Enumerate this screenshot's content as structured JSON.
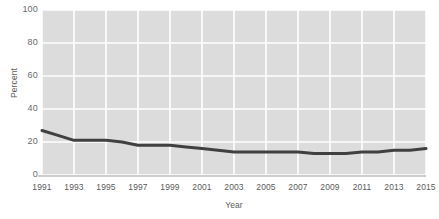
{
  "chart_data": {
    "type": "line",
    "title": "",
    "xlabel": "Year",
    "ylabel": "Percent",
    "x": [
      1991,
      1992,
      1993,
      1994,
      1995,
      1996,
      1997,
      1998,
      1999,
      2000,
      2001,
      2002,
      2003,
      2004,
      2005,
      2006,
      2007,
      2008,
      2009,
      2010,
      2011,
      2012,
      2013,
      2014,
      2015
    ],
    "values": [
      27,
      24,
      21,
      21,
      21,
      20,
      18,
      18,
      18,
      17,
      16,
      15,
      14,
      14,
      14,
      14,
      14,
      13,
      13,
      13,
      14,
      14,
      15,
      15,
      16
    ],
    "series": [
      {
        "name": "Percent",
        "color": "#404040",
        "values": [
          27,
          24,
          21,
          21,
          21,
          20,
          18,
          18,
          18,
          17,
          16,
          15,
          14,
          14,
          14,
          14,
          14,
          13,
          13,
          13,
          14,
          14,
          15,
          15,
          16
        ]
      }
    ],
    "xlim": [
      1991,
      2015
    ],
    "ylim": [
      0,
      100
    ],
    "y_ticks": [
      0,
      20,
      40,
      60,
      80,
      100
    ],
    "y_tick_labels": [
      "0",
      "20",
      "40",
      "60",
      "80",
      "100"
    ],
    "x_ticks": [
      1991,
      1993,
      1995,
      1997,
      1999,
      2001,
      2003,
      2005,
      2007,
      2009,
      2011,
      2013,
      2015
    ],
    "x_tick_labels": [
      "1991",
      "1993",
      "1995",
      "1997",
      "1999",
      "2001",
      "2003",
      "2005",
      "2007",
      "2009",
      "2011",
      "2013",
      "2015"
    ],
    "grid": true,
    "grid_color": "#ffffff",
    "plot_background": "#dcdcdc",
    "legend": null,
    "legend_position": "none"
  }
}
